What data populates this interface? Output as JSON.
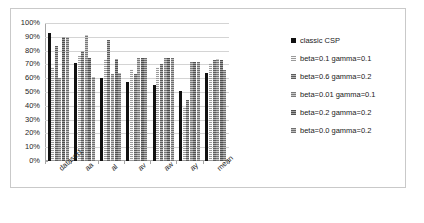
{
  "chart_data": {
    "type": "bar",
    "title": "",
    "xlabel": "",
    "ylabel": "",
    "ylim": [
      0,
      100
    ],
    "ytick_labels": [
      "100%",
      "90%",
      "80%",
      "70%",
      "60%",
      "50%",
      "40%",
      "30%",
      "20%",
      "10%",
      "0%"
    ],
    "ytick_values": [
      100,
      90,
      80,
      70,
      60,
      50,
      40,
      30,
      20,
      10,
      0
    ],
    "grid": true,
    "legend_position": "right",
    "categories": [
      "dataset1",
      "aa",
      "al",
      "av",
      "aw",
      "ay",
      "mean"
    ],
    "series": [
      {
        "name": "classic CSP",
        "color": "#111111",
        "values": [
          93,
          71,
          60,
          57,
          55,
          51,
          64
        ]
      },
      {
        "name": "beta=0.1 gamma=0.1",
        "color": "#f2f2f2",
        "values": [
          68,
          76,
          74,
          67,
          68,
          39,
          71
        ]
      },
      {
        "name": "beta=0.6 gamma=0.2",
        "color": "#8e8e8e",
        "values": [
          83,
          80,
          88,
          63,
          70,
          44,
          73
        ]
      },
      {
        "name": "beta=0.01 gamma=0.1",
        "color": "#a8a8a8",
        "values": [
          60,
          91,
          63,
          75,
          75,
          72,
          74
        ]
      },
      {
        "name": "beta=0.2 gamma=0.2",
        "color": "#7e7e7e",
        "values": [
          90,
          75,
          74,
          75,
          75,
          72,
          73
        ]
      },
      {
        "name": "beta=0.0 gamma=0.2",
        "color": "#9d9d9d",
        "values": [
          90,
          61,
          64,
          75,
          75,
          72,
          66
        ]
      }
    ]
  },
  "caption": {
    "text": ""
  }
}
